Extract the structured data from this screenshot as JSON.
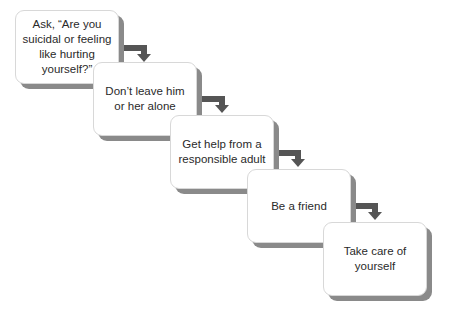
{
  "diagram": {
    "type": "staircase-flow",
    "steps": [
      {
        "label": "Ask, “Are you suicidal or feeling like hurting yourself?”"
      },
      {
        "label": "Don’t leave him or her alone"
      },
      {
        "label": "Get help from a responsible adult"
      },
      {
        "label": "Be a friend"
      },
      {
        "label": "Take care of yourself"
      }
    ],
    "colors": {
      "box_fill": "#ffffff",
      "box_shadow": "#8a8a8a",
      "arrow": "#555555",
      "background": "#ffffff"
    }
  }
}
